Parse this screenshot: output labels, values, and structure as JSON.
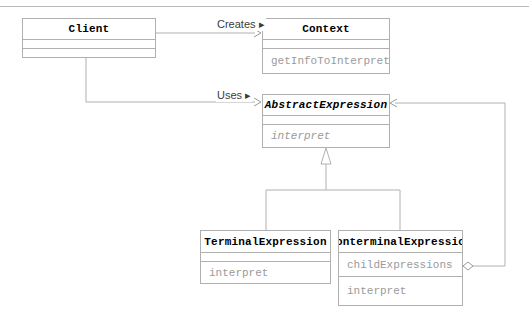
{
  "diagram": {
    "type": "uml-class-diagram",
    "pattern": "Interpreter",
    "line_color": "#b0b0b0",
    "title_color": "#000000",
    "member_color": "#9a9a9a",
    "label_color": "#3b3b3b",
    "background": "#ffffff"
  },
  "classes": [
    {
      "id": "client",
      "name": "Client",
      "abstract": false,
      "attributes": [],
      "operations": [],
      "x": 22,
      "y": 18,
      "width": 134,
      "height": 40,
      "rows": [
        20,
        10,
        10
      ]
    },
    {
      "id": "context",
      "name": "Context",
      "abstract": false,
      "attributes": [],
      "operations": [
        "getInfoToInterpret"
      ],
      "x": 262,
      "y": 18,
      "width": 128,
      "height": 56,
      "rows": [
        20,
        10,
        25
      ]
    },
    {
      "id": "abstract-expression",
      "name": "AbstractExpression",
      "abstract": true,
      "attributes": [],
      "operations": [
        "interpret"
      ],
      "x": 262,
      "y": 94,
      "width": 128,
      "height": 54,
      "rows": [
        20,
        10,
        23
      ]
    },
    {
      "id": "terminal-expression",
      "name": "TerminalExpression",
      "abstract": false,
      "attributes": [],
      "operations": [
        "interpret"
      ],
      "x": 200,
      "y": 230,
      "width": 131,
      "height": 54,
      "rows": [
        21,
        10,
        22
      ]
    },
    {
      "id": "nonterminal-expression",
      "name": "NonterminalExpression",
      "abstract": false,
      "attributes": [
        "childExpressions"
      ],
      "operations": [
        "interpret"
      ],
      "x": 338,
      "y": 230,
      "width": 125,
      "height": 76,
      "rows": [
        21,
        24,
        30
      ]
    }
  ],
  "relations": [
    {
      "id": "creates",
      "label": "Creates ▸",
      "kind": "dependency",
      "from": "client",
      "to": "context",
      "label_x": 216,
      "label_y": 18
    },
    {
      "id": "uses",
      "label": "Uses ▸",
      "kind": "dependency",
      "from": "client",
      "to": "abstract-expression",
      "label_x": 216,
      "label_y": 89
    },
    {
      "id": "terminal-generalization",
      "label": "",
      "kind": "generalization",
      "from": "terminal-expression",
      "to": "abstract-expression"
    },
    {
      "id": "nonterminal-generalization",
      "label": "",
      "kind": "generalization",
      "from": "nonterminal-expression",
      "to": "abstract-expression"
    },
    {
      "id": "child-aggregation",
      "label": "",
      "kind": "aggregation",
      "from": "nonterminal-expression",
      "to": "abstract-expression"
    }
  ]
}
